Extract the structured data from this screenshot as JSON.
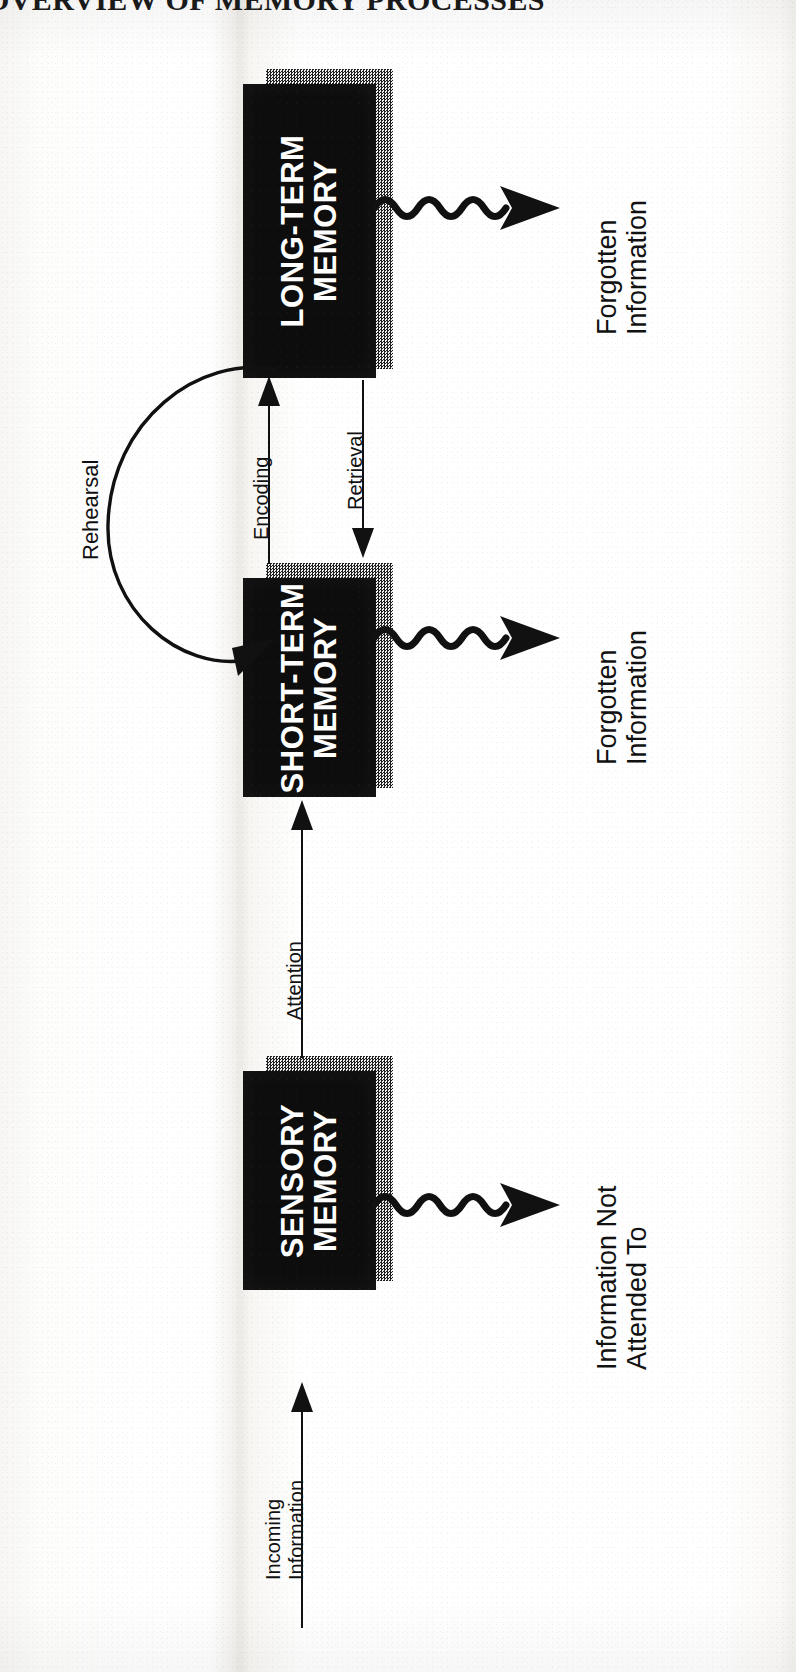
{
  "page": {
    "title": "OVERVIEW OF MEMORY PROCESSES",
    "orientation": "rotated-90-ccw",
    "ink_color": "#111111",
    "box_fill": "#0d0d0d",
    "box_text_color": "#ffffff",
    "shadow_color": "#8c8c8c"
  },
  "diagram": {
    "boxes": [
      {
        "id": "sensory",
        "line1": "SENSORY",
        "line2": "MEMORY"
      },
      {
        "id": "short-term",
        "line1": "SHORT-TERM",
        "line2": "MEMORY"
      },
      {
        "id": "long-term",
        "line1": "LONG-TERM",
        "line2": "MEMORY"
      }
    ],
    "flow_labels": {
      "incoming": "Incoming\nInformation",
      "attention": "Attention",
      "encoding": "Encoding",
      "retrieval": "Retrieval",
      "rehearsal": "Rehearsal"
    },
    "outcome_labels": [
      {
        "id": "not-attended",
        "text": "Information Not\nAttended To"
      },
      {
        "id": "forgotten-stm",
        "text": "Forgotten\nInformation"
      },
      {
        "id": "forgotten-ltm",
        "text": "Forgotten\nInformation"
      }
    ],
    "arrows": [
      {
        "id": "incoming-to-sensory",
        "from": "Incoming Information",
        "to": "SENSORY MEMORY",
        "style": "straight",
        "label": "Incoming Information"
      },
      {
        "id": "sensory-to-stm",
        "from": "SENSORY MEMORY",
        "to": "SHORT-TERM MEMORY",
        "style": "straight",
        "label": "Attention"
      },
      {
        "id": "stm-to-ltm",
        "from": "SHORT-TERM MEMORY",
        "to": "LONG-TERM MEMORY",
        "style": "straight",
        "label": "Encoding"
      },
      {
        "id": "ltm-to-stm",
        "from": "LONG-TERM MEMORY",
        "to": "SHORT-TERM MEMORY",
        "style": "straight",
        "label": "Retrieval"
      },
      {
        "id": "stm-rehearsal-loop",
        "from": "SHORT-TERM MEMORY",
        "to": "SHORT-TERM MEMORY",
        "style": "curved-loop",
        "label": "Rehearsal"
      },
      {
        "id": "sensory-loss",
        "from": "SENSORY MEMORY",
        "to": "Information Not Attended To",
        "style": "wavy"
      },
      {
        "id": "stm-loss",
        "from": "SHORT-TERM MEMORY",
        "to": "Forgotten Information",
        "style": "wavy"
      },
      {
        "id": "ltm-loss",
        "from": "LONG-TERM MEMORY",
        "to": "Forgotten Information",
        "style": "wavy"
      }
    ]
  }
}
